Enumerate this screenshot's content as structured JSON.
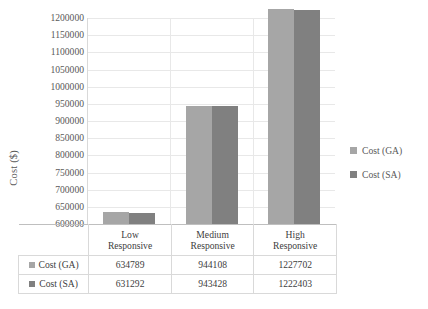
{
  "chart_data": {
    "type": "bar",
    "title": "",
    "xlabel": "",
    "ylabel": "Cost ($)",
    "ylim": [
      600000,
      1200000
    ],
    "ytick_step": 50000,
    "yticks": [
      1200000,
      1150000,
      1100000,
      1050000,
      1000000,
      950000,
      900000,
      850000,
      800000,
      750000,
      700000,
      650000,
      600000
    ],
    "ytick_labels": [
      "1200000",
      "1150000",
      "1100000",
      "1050000",
      "1000000",
      "950000",
      "900000",
      "850000",
      "800000",
      "750000",
      "700000",
      "650000",
      "600000"
    ],
    "categories": [
      "Low Responsive",
      "Medium Responsive",
      "High Responsive"
    ],
    "category_lines": [
      [
        "Low",
        "Responsive"
      ],
      [
        "Medium",
        "Responsive"
      ],
      [
        "High",
        "Responsive"
      ]
    ],
    "series": [
      {
        "name": "Cost (GA)",
        "color": "#a6a6a6",
        "values": [
          634789,
          944108,
          1227702
        ]
      },
      {
        "name": "Cost (SA)",
        "color": "#808080",
        "values": [
          631292,
          943428,
          1222403
        ]
      }
    ],
    "grid": true,
    "legend_position": "right",
    "data_table_visible": true
  },
  "legend": {
    "items": [
      {
        "label": "Cost (GA)",
        "color": "#a6a6a6"
      },
      {
        "label": "Cost (SA)",
        "color": "#808080"
      }
    ]
  },
  "table": {
    "corner": "",
    "column_headers": [
      {
        "line1": "Low",
        "line2": "Responsive"
      },
      {
        "line1": "Medium",
        "line2": "Responsive"
      },
      {
        "line1": "High",
        "line2": "Responsive"
      }
    ],
    "rows": [
      {
        "label": "Cost (GA)",
        "color": "#a6a6a6",
        "cells": [
          "634789",
          "944108",
          "1227702"
        ]
      },
      {
        "label": "Cost (SA)",
        "color": "#808080",
        "cells": [
          "631292",
          "943428",
          "1222403"
        ]
      }
    ]
  },
  "colors": {
    "series_ga": "#a6a6a6",
    "series_sa": "#808080",
    "gridline": "#e8e8e8",
    "axis": "#bfbfbf",
    "text": "#404040"
  }
}
